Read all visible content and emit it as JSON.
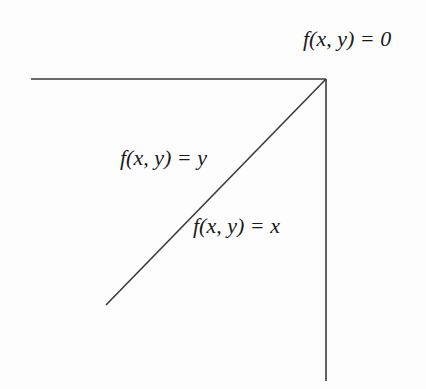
{
  "figure": {
    "labels": {
      "top": "f(x, y) = 0",
      "diagonal_upper": "f(x, y) = y",
      "diagonal_lower": "f(x, y) = x"
    },
    "colors": {
      "line": "#3a3a3a",
      "text": "#1a1a1a",
      "background": "#fdfdfd"
    }
  }
}
